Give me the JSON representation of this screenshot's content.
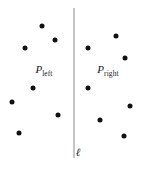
{
  "figure": {
    "width": 154,
    "height": 173,
    "background": "#ffffff",
    "point_color": "#111111",
    "line_color": "#8c8c8c",
    "text_color": "#1a1a1a"
  },
  "labels": {
    "left_set": {
      "base": "P",
      "sub": "left",
      "x": 44,
      "y": 71
    },
    "right_set": {
      "base": "P",
      "sub": "right",
      "x": 108,
      "y": 71
    },
    "line": {
      "text": "ℓ",
      "x": 78,
      "y": 152
    }
  },
  "divider": {
    "name": "l",
    "x": 74,
    "y_top": 8,
    "y_bottom": 158
  },
  "chart_data": {
    "type": "scatter",
    "title": "",
    "xlabel": "",
    "ylabel": "",
    "xlim": [
      0,
      154
    ],
    "ylim": [
      0,
      173
    ],
    "grid": false,
    "legend": "none",
    "annotations": [
      "P_left",
      "P_right",
      "ℓ"
    ],
    "series": [
      {
        "name": "P_left",
        "color": "#111111",
        "points": [
          {
            "x": 42,
            "y": 26
          },
          {
            "x": 55,
            "y": 40
          },
          {
            "x": 25,
            "y": 48
          },
          {
            "x": 33,
            "y": 88
          },
          {
            "x": 12,
            "y": 102
          },
          {
            "x": 58,
            "y": 115
          },
          {
            "x": 19,
            "y": 133
          }
        ]
      },
      {
        "name": "P_right",
        "color": "#111111",
        "points": [
          {
            "x": 116,
            "y": 36
          },
          {
            "x": 88,
            "y": 48
          },
          {
            "x": 125,
            "y": 58
          },
          {
            "x": 88,
            "y": 88
          },
          {
            "x": 130,
            "y": 106
          },
          {
            "x": 100,
            "y": 120
          },
          {
            "x": 124,
            "y": 136
          }
        ]
      }
    ]
  }
}
